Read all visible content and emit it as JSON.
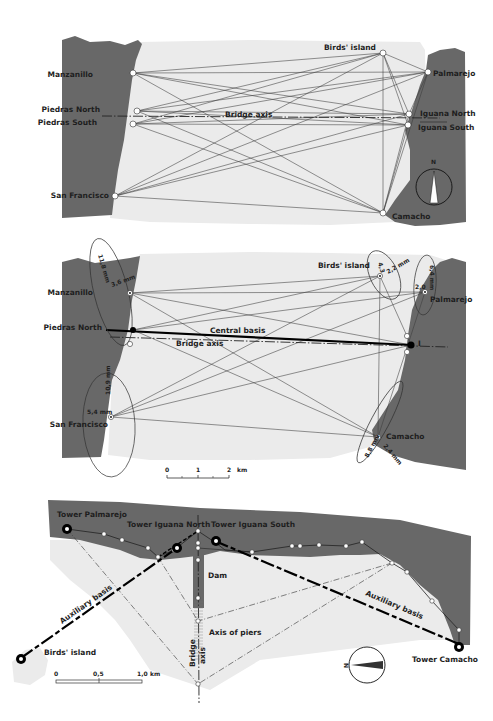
{
  "colors": {
    "land": "#686868",
    "water": "#ebebeb",
    "line": "#3a3a3a",
    "background": "#ffffff"
  },
  "panel1": {
    "title": "Triangulation network",
    "stations": {
      "manzanillo": "Manzanillo",
      "piedras_north": "Piedras North",
      "piedras_south": "Piedras South",
      "san_francisco": "San Francisco",
      "birds_island": "Birds' island",
      "palmarejo": "Palmarejo",
      "iguana_north": "Iguana North",
      "iguana_south": "Iguana South",
      "camacho": "Camacho"
    },
    "bridge_axis_label": "Bridge axis",
    "north_label": "N"
  },
  "panel2": {
    "stations": {
      "manzanillo": "Manzanillo",
      "piedras_north": "Piedras North",
      "san_francisco": "San Francisco",
      "birds_island": "Birds' island",
      "palmarejo": "Palmarejo",
      "camacho": "Camacho",
      "point_i": "I"
    },
    "central_basis_label": "Central basis",
    "bridge_axis_label": "Bridge axis",
    "error_ellipses": {
      "manzanillo_major": "11,8 mm",
      "manzanillo_minor": "3,6 mm",
      "san_francisco_major": "10,9 mm",
      "san_francisco_minor": "5,4 mm",
      "birds_major": "4,3",
      "birds_minor": "2,2 mm",
      "palmarejo_major": "6,4 mm",
      "palmarejo_minor": "2,0",
      "camacho_major": "8,8 mm",
      "camacho_minor": "2,4 mm"
    },
    "scale": {
      "ticks": [
        "0",
        "1",
        "2"
      ],
      "unit": "km"
    }
  },
  "panel3": {
    "towers": {
      "palmarejo": "Tower Palmarejo",
      "iguana_north": "Tower Iguana North",
      "iguana_south": "Tower Iguana South",
      "camacho": "Tower Camacho"
    },
    "birds_island": "Birds' island",
    "dam_label": "Dam",
    "axis_of_piers_label": "Axis of piers",
    "bridge_axis_label_1": "Bridge",
    "bridge_axis_label_2": "axis",
    "auxiliary_basis_left": "Auxiliary basis",
    "auxiliary_basis_right": "Auxiliary basis",
    "north_label": "N",
    "scale": {
      "ticks": [
        "0",
        "0,5",
        "1,0"
      ],
      "unit": "km"
    }
  }
}
